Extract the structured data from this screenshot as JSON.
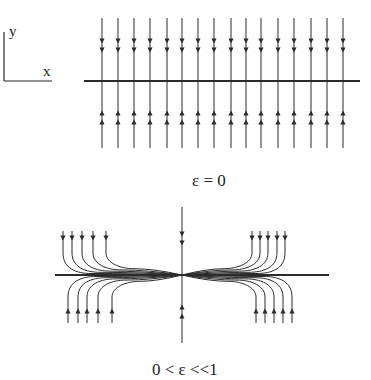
{
  "axes_legend": {
    "x_label": "x",
    "y_label": "y"
  },
  "panels": [
    {
      "id": "top",
      "caption": "ε = 0",
      "description": "Uniform vertical flow toward the x-axis (slow manifold) — all trajectories move straight to the line",
      "axis": {
        "x1": 84,
        "x2": 360,
        "y": 81
      },
      "vertical_lines_x": [
        102,
        118,
        134,
        150,
        167,
        182,
        198,
        214,
        231,
        246,
        261,
        278,
        294,
        311,
        327,
        343
      ],
      "line_top": 18,
      "line_bottom": 148,
      "down_arrows_y": [
        41,
        50
      ],
      "up_arrows_y": [
        113,
        122
      ]
    },
    {
      "id": "bottom",
      "caption": "0 < ε <<1",
      "description": "Trajectories fall vertically toward the x-axis then flow along it into the origin",
      "h_axis": {
        "x1": 55,
        "x2": 329,
        "y": 275
      },
      "v_axis": {
        "x": 182,
        "y1": 207,
        "y2": 343
      },
      "center": {
        "x": 182,
        "y": 275
      },
      "top_left_x": [
        63,
        72,
        82,
        93,
        106
      ],
      "bottom_left_x": [
        68,
        78,
        87,
        98,
        112
      ],
      "top_right_x": [
        252,
        260,
        268,
        277,
        285
      ],
      "bottom_right_x": [
        256,
        265,
        274,
        283,
        292
      ],
      "top_start_y": 231,
      "bottom_end_y": 323,
      "v_axis_down_arrows_y": [
        234,
        243
      ],
      "v_axis_up_arrows_y": [
        307,
        316
      ]
    }
  ],
  "colors": {
    "stroke": "#2a2a2a",
    "background": "#ffffff"
  }
}
